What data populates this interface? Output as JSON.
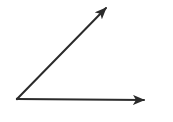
{
  "diagram": {
    "type": "angle",
    "stroke_color": "#2b2b2b",
    "background": "#ffffff",
    "vertex": {
      "x": 17,
      "y": 99
    },
    "rays": [
      {
        "name": "inclined-ray",
        "from": {
          "x": 17,
          "y": 99
        },
        "to": {
          "x": 106,
          "y": 8
        }
      },
      {
        "name": "horizontal-ray",
        "from": {
          "x": 17,
          "y": 99
        },
        "to": {
          "x": 144,
          "y": 100
        }
      }
    ],
    "labels": []
  }
}
